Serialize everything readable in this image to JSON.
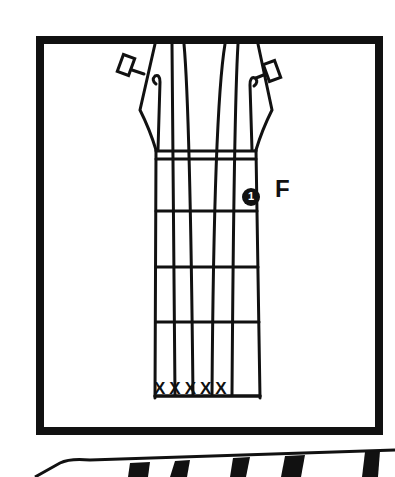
{
  "diagram": {
    "note_label": "F",
    "finger_number": "1",
    "muted_strings": "XXXXX",
    "colors": {
      "ink": "#111111",
      "background": "#ffffff"
    }
  }
}
